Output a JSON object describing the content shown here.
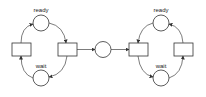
{
  "diagram": {
    "type": "petri-net",
    "left_net": {
      "places": [
        {
          "id": "ready",
          "label": "ready"
        },
        {
          "id": "wait",
          "label": "wait"
        }
      ],
      "transitions": [
        {
          "id": "t_left",
          "label": ""
        },
        {
          "id": "t_right",
          "label": ""
        }
      ]
    },
    "shared_place": {
      "id": "channel",
      "label": ""
    },
    "right_net": {
      "places": [
        {
          "id": "ready",
          "label": "ready"
        },
        {
          "id": "wait",
          "label": "wait"
        }
      ],
      "transitions": [
        {
          "id": "t_left",
          "label": ""
        },
        {
          "id": "t_right",
          "label": ""
        }
      ]
    }
  }
}
